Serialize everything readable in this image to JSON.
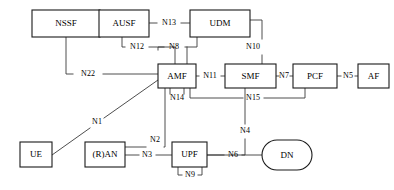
{
  "diagram": {
    "type": "network-architecture",
    "canvas": {
      "width": 394,
      "height": 190
    },
    "nodes": [
      {
        "id": "nssf",
        "label": "NSSF",
        "shape": "rect",
        "x": 32,
        "y": 10,
        "w": 68,
        "h": 27
      },
      {
        "id": "ausf",
        "label": "AUSF",
        "shape": "rect",
        "x": 99,
        "y": 10,
        "w": 50,
        "h": 27
      },
      {
        "id": "udm",
        "label": "UDM",
        "shape": "rect",
        "x": 190,
        "y": 10,
        "w": 60,
        "h": 27
      },
      {
        "id": "amf",
        "label": "AMF",
        "shape": "rect",
        "x": 158,
        "y": 64,
        "w": 38,
        "h": 24
      },
      {
        "id": "smf",
        "label": "SMF",
        "shape": "rect",
        "x": 225,
        "y": 64,
        "w": 51,
        "h": 24
      },
      {
        "id": "pcf",
        "label": "PCF",
        "shape": "rect",
        "x": 293,
        "y": 64,
        "w": 44,
        "h": 24
      },
      {
        "id": "af",
        "label": "AF",
        "shape": "rect",
        "x": 358,
        "y": 64,
        "w": 31,
        "h": 24
      },
      {
        "id": "ue",
        "label": "UE",
        "shape": "rect",
        "x": 20,
        "y": 142,
        "w": 32,
        "h": 25
      },
      {
        "id": "ran",
        "label": "(R)AN",
        "shape": "rect",
        "x": 85,
        "y": 142,
        "w": 40,
        "h": 25
      },
      {
        "id": "upf",
        "label": "UPF",
        "shape": "rect",
        "x": 172,
        "y": 142,
        "w": 35,
        "h": 25
      },
      {
        "id": "dn",
        "label": "DN",
        "shape": "ellipse",
        "x": 262,
        "y": 140,
        "w": 50,
        "h": 30
      }
    ],
    "links": [
      {
        "id": "n13",
        "label": "N13",
        "from": "ausf",
        "to": "udm",
        "lx": 169,
        "ly": 23,
        "path": "M 149,23 L 157,23 M 181,23 L 190,23"
      },
      {
        "id": "n12",
        "label": "N12",
        "from": "ausf",
        "to": "amf",
        "lx": 137,
        "ly": 47,
        "path": "M 122,37 L 122,47 L 125,47 M 149,47 L 175,47 L 175,64"
      },
      {
        "id": "n8",
        "label": "N8",
        "from": "udm",
        "to": "amf",
        "lx": 174,
        "ly": 47,
        "path": "M 197,37 L 197,47 L 185,47 M 164,47 L 158,47 L 158,50 M 187,47 L 187,64"
      },
      {
        "id": "n10",
        "label": "N10",
        "from": "udm",
        "to": "smf",
        "lx": 253,
        "ly": 47,
        "path": "M 250,20 L 262,20 L 262,39 M 262,55 L 262,64"
      },
      {
        "id": "n22",
        "label": "N22",
        "from": "nssf",
        "to": "amf",
        "lx": 88,
        "ly": 74,
        "path": "M 66,37 L 66,74 L 73,74 M 103,74 L 158,74"
      },
      {
        "id": "n11",
        "label": "N11",
        "from": "amf",
        "to": "smf",
        "lx": 210,
        "ly": 76,
        "path": "M 196,76 L 199,76 M 221,76 L 225,76"
      },
      {
        "id": "n7",
        "label": "N7",
        "from": "smf",
        "to": "pcf",
        "lx": 284,
        "ly": 76,
        "path": "M 276,76 L 279,76 M 290,76 L 293,76"
      },
      {
        "id": "n5",
        "label": "N5",
        "from": "pcf",
        "to": "af",
        "lx": 348,
        "ly": 76,
        "path": "M 337,76 L 341,76 M 355,76 L 358,76"
      },
      {
        "id": "n15",
        "label": "N15",
        "from": "amf",
        "to": "pcf",
        "lx": 253,
        "ly": 98,
        "path": "M 190,88 L 190,98 L 243,98 M 264,98 L 305,98 L 305,88"
      },
      {
        "id": "n14",
        "label": "N14",
        "from": "amf",
        "to": "amf",
        "lx": 177,
        "ly": 98,
        "path": "M 170,88 L 170,94 M 184,94 L 184,88"
      },
      {
        "id": "n1",
        "label": "N1",
        "from": "ue",
        "to": "amf",
        "lx": 97,
        "ly": 122,
        "path": "M 158,80 L 104,118 M 90,128 L 45,160"
      },
      {
        "id": "n2",
        "label": "N2",
        "from": "ran",
        "to": "amf",
        "lx": 155,
        "ly": 140,
        "path": "M 125,147 L 146,147 M 164,147 L 165,147 L 165,88"
      },
      {
        "id": "n3",
        "label": "N3",
        "from": "ran",
        "to": "upf",
        "lx": 147,
        "ly": 155,
        "path": "M 125,155 L 139,155 M 156,155 L 172,155"
      },
      {
        "id": "n9",
        "label": "N9",
        "from": "upf",
        "to": "upf",
        "lx": 190,
        "ly": 175,
        "path": "M 178,167 L 178,175 L 182,175 M 198,175 L 202,175 L 202,167"
      },
      {
        "id": "n4",
        "label": "N4",
        "from": "smf",
        "to": "upf",
        "lx": 245,
        "ly": 131,
        "path": "M 245,88 L 245,124 M 245,139 L 245,155 L 207,155"
      },
      {
        "id": "n6",
        "label": "N6",
        "from": "upf",
        "to": "dn",
        "lx": 233,
        "ly": 155,
        "path": "M 207,155 L 224,155 M 242,155 L 262,155"
      }
    ]
  }
}
